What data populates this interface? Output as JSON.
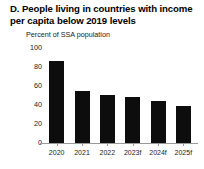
{
  "panel": {
    "title": "D. People living in countries with income per capita below 2019 levels",
    "title_line1": "D. People living in countries with",
    "title_line2": "income per capita below 2019 levels",
    "subtitle": "Percent of SSA population",
    "bar_color": "#0d0d0d",
    "axis_color": "#9a9a9a"
  },
  "chart_data": {
    "type": "bar",
    "title": "D. People living in countries with income per capita below 2019 levels",
    "subtitle": "Percent of SSA population",
    "xlabel": "",
    "ylabel": "Percent of SSA population",
    "categories": [
      "2020",
      "2021",
      "2022",
      "2023f",
      "2024f",
      "2025f"
    ],
    "values": [
      86,
      55,
      51,
      48,
      44,
      39
    ],
    "series": [
      {
        "name": "Percent of SSA population",
        "values": [
          86,
          55,
          51,
          48,
          44,
          39
        ]
      }
    ],
    "ylim": [
      0,
      100
    ],
    "yticks": [
      0,
      20,
      40,
      60,
      80,
      100
    ],
    "ytick_labels": [
      "0",
      "20",
      "40",
      "60",
      "80",
      "100"
    ],
    "grid": false,
    "legend": false,
    "legend_position": "none"
  }
}
